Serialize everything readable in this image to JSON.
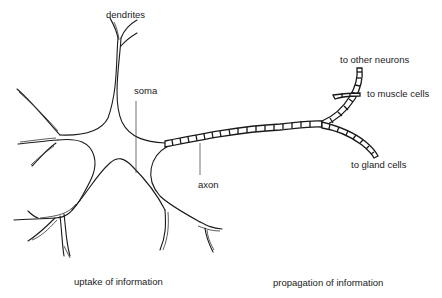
{
  "diagram": {
    "type": "neuron anatomy illustration",
    "background": "#ffffff",
    "line_color": "#1a1a1a",
    "labels": {
      "dendrites": "dendrites",
      "soma": "soma",
      "axon": "axon",
      "to_other_neurons": "to other neurons",
      "to_muscle_cells": "to muscle cells",
      "to_gland_cells": "to gland cells",
      "uptake": "uptake of information",
      "propagation": "propagation of information"
    },
    "parts": [
      {
        "name": "dendrites",
        "description": "branching processes from the cell body"
      },
      {
        "name": "soma",
        "description": "cell body"
      },
      {
        "name": "axon",
        "description": "myelinated fiber with segmented sheath, branching into three terminals"
      }
    ]
  }
}
